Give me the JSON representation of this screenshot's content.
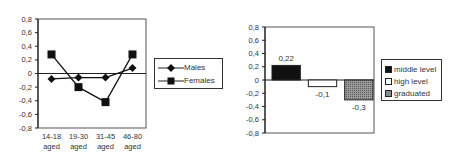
{
  "chart_data": [
    {
      "type": "line",
      "title": "",
      "xlabel": "",
      "ylabel": "",
      "categories": [
        "14-18 aged",
        "19-30 aged",
        "31-45 aged",
        "46-80 aged"
      ],
      "category_lines": [
        [
          "14-18",
          "aged"
        ],
        [
          "19-30",
          "aged"
        ],
        [
          "31-45",
          "aged"
        ],
        [
          "46-80",
          "aged"
        ]
      ],
      "series": [
        {
          "name": "Males",
          "marker": "diamond",
          "values": [
            -0.08,
            -0.06,
            -0.06,
            0.08
          ]
        },
        {
          "name": "Females",
          "marker": "square",
          "values": [
            0.28,
            -0.2,
            -0.42,
            0.28
          ]
        }
      ],
      "ylim": [
        -0.8,
        0.8
      ],
      "yticks": [
        "0,8",
        "0,6",
        "0,4",
        "0,2",
        "0",
        "-0,2",
        "-0,4",
        "-0,6",
        "-0,8"
      ],
      "grid": false,
      "legend_position": "right"
    },
    {
      "type": "bar",
      "title": "",
      "xlabel": "",
      "ylabel": "",
      "categories": [
        "middle level",
        "high level",
        "graduated"
      ],
      "values": [
        0.22,
        -0.1,
        -0.3
      ],
      "data_labels": [
        "0,22",
        "-0,1",
        "-0,3"
      ],
      "colors": [
        "#111111",
        "#ffffff",
        "#8a8a8a"
      ],
      "ylim": [
        -0.8,
        0.8
      ],
      "yticks": [
        "0,8",
        "0,6",
        "0,4",
        "0,2",
        "0",
        "-0,2",
        "-0,4",
        "-0,6",
        "-0,8"
      ],
      "grid": false,
      "legend_position": "right"
    }
  ],
  "legend1": {
    "items": [
      "Males",
      "Females"
    ]
  },
  "legend2": {
    "items": [
      "middle level",
      "high level",
      "graduated"
    ]
  }
}
